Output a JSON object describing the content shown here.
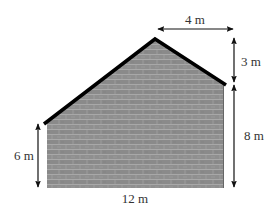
{
  "diagram": {
    "type": "wall-elevation",
    "colors": {
      "brick_fill": "#8f8f8f",
      "brick_dark": "#7e7e7e",
      "mortar": "#b4b4b4",
      "roof_line": "#000000",
      "dimension_line": "#111111",
      "label_text": "#333333",
      "background": "#ffffff"
    },
    "shape_points": {
      "bottom_left": [
        47,
        188
      ],
      "top_left": [
        47,
        123
      ],
      "peak": [
        155,
        39
      ],
      "top_right": [
        224,
        84
      ],
      "bottom_right": [
        224,
        188
      ]
    },
    "dimensions": [
      {
        "id": "left-height",
        "label": "6 m",
        "value": 6,
        "unit": "m",
        "orientation": "vertical"
      },
      {
        "id": "bottom-width",
        "label": "12 m",
        "value": 12,
        "unit": "m",
        "orientation": "horizontal"
      },
      {
        "id": "peak-offset",
        "label": "4 m",
        "value": 4,
        "unit": "m",
        "orientation": "horizontal"
      },
      {
        "id": "roof-rise",
        "label": "3 m",
        "value": 3,
        "unit": "m",
        "orientation": "vertical"
      },
      {
        "id": "right-height",
        "label": "8 m",
        "value": 8,
        "unit": "m",
        "orientation": "vertical"
      }
    ]
  },
  "labels": {
    "left_height": "6 m",
    "bottom_width": "12 m",
    "peak_offset": "4 m",
    "roof_rise": "3 m",
    "right_height": "8 m"
  }
}
